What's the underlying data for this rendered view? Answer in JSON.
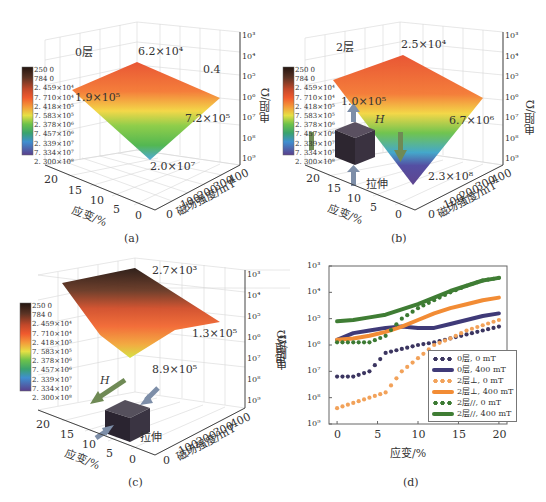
{
  "colorbar": {
    "labels": [
      "250 0",
      "784 0",
      "2. 459×10⁴",
      "7. 710×10⁴",
      "2. 418×10⁵",
      "7. 583×10⁵",
      "2. 378×10⁶",
      "7. 457×10⁶",
      "2. 339×10⁷",
      "7. 334×10⁷",
      "2. 300×10⁸"
    ],
    "colors": [
      "#2b1a14",
      "#5a3324",
      "#8a4a30",
      "#e0582f",
      "#f26a34",
      "#f4c23e",
      "#b9dc3e",
      "#4fb548",
      "#3fa5c9",
      "#4f4aa0",
      "#5a3f8c"
    ]
  },
  "panels": {
    "a": {
      "caption": "(a)",
      "label": "0层",
      "annotations": [
        "6.2×10⁴",
        "0.4",
        "1.9×10⁵",
        "7.2×10⁵",
        "2.0×10⁷"
      ],
      "z_ticks": [
        "10³",
        "10⁴",
        "10⁵",
        "10⁶",
        "10⁷",
        "10⁸",
        "10⁹"
      ],
      "z_label": "电阻/Ω",
      "strain_ticks": [
        "20",
        "15",
        "10",
        "5",
        "0"
      ],
      "strain_label": "应变/%",
      "field_ticks": [
        "0",
        "100",
        "200",
        "300",
        "400"
      ],
      "field_label": "磁场强度/mT"
    },
    "b": {
      "caption": "(b)",
      "label": "2层",
      "annotations": [
        "2.5×10⁴",
        "1.0×10⁵",
        "6.7×10⁶",
        "2.3×10⁸"
      ],
      "field_symbol": "H",
      "stretch_label": "拉伸",
      "z_ticks": [
        "10³",
        "10⁴",
        "10⁵",
        "10⁶",
        "10⁷",
        "10⁸",
        "10⁹"
      ],
      "z_label": "电阻/Ω",
      "strain_ticks": [
        "20",
        "15",
        "10",
        "5",
        "0"
      ],
      "strain_label": "应变/%",
      "field_ticks": [
        "0",
        "100",
        "200",
        "300",
        "400"
      ],
      "field_label": "磁场强度/mT"
    },
    "c": {
      "caption": "(c)",
      "annotations": [
        "2.7×10³",
        "1.3×10⁵",
        "8.9×10⁵"
      ],
      "field_symbol": "H",
      "stretch_label": "拉伸",
      "z_ticks": [
        "10³",
        "10⁴",
        "10⁵",
        "10⁶",
        "10⁷",
        "10⁸",
        "10⁹"
      ],
      "z_label": "电阻/Ω",
      "strain_ticks": [
        "20",
        "15",
        "10",
        "5",
        "0"
      ],
      "strain_label": "应变/%",
      "field_ticks": [
        "0",
        "100",
        "200",
        "300",
        "400"
      ],
      "field_label": "磁场强度/mT"
    },
    "d": {
      "caption": "(d)"
    }
  },
  "chart_data": [
    {
      "type": "surface",
      "panel": "a",
      "title": "0层",
      "xlabel": "应变/%",
      "ylabel": "磁场强度/mT",
      "zlabel": "电阻/Ω",
      "x_ticks": [
        0,
        5,
        10,
        15,
        20
      ],
      "y_ticks": [
        0,
        100,
        200,
        300,
        400
      ],
      "z_ticks": [
        "1e3",
        "1e4",
        "1e5",
        "1e6",
        "1e7",
        "1e8",
        "1e9"
      ],
      "zscale": "log-reversed",
      "annotations": [
        {
          "text": "6.2×10⁴",
          "strain": 20,
          "field": 400
        },
        {
          "text": "1.9×10⁵",
          "strain": 20,
          "field": 0
        },
        {
          "text": "7.2×10⁵",
          "strain": 0,
          "field": 400
        },
        {
          "text": "2.0×10⁷",
          "strain": 0,
          "field": 0
        },
        {
          "text": "0.4",
          "note": "label near back wall"
        }
      ]
    },
    {
      "type": "surface",
      "panel": "b",
      "title": "2层",
      "xlabel": "应变/%",
      "ylabel": "磁场强度/mT",
      "zlabel": "电阻/Ω",
      "x_ticks": [
        0,
        5,
        10,
        15,
        20
      ],
      "y_ticks": [
        0,
        100,
        200,
        300,
        400
      ],
      "z_ticks": [
        "1e3",
        "1e4",
        "1e5",
        "1e6",
        "1e7",
        "1e8",
        "1e9"
      ],
      "zscale": "log-reversed",
      "annotations": [
        {
          "text": "2.5×10⁴",
          "strain": 20,
          "field": 400
        },
        {
          "text": "1.0×10⁵",
          "strain": 20,
          "field": 0
        },
        {
          "text": "6.7×10⁶",
          "strain": 0,
          "field": 400
        },
        {
          "text": "2.3×10⁸",
          "strain": 0,
          "field": 0
        }
      ],
      "inset": "field H perpendicular to stretching direction (拉伸)"
    },
    {
      "type": "surface",
      "panel": "c",
      "xlabel": "应变/%",
      "ylabel": "磁场强度/mT",
      "zlabel": "电阻/Ω",
      "x_ticks": [
        0,
        5,
        10,
        15,
        20
      ],
      "y_ticks": [
        0,
        100,
        200,
        300,
        400
      ],
      "z_ticks": [
        "1e3",
        "1e4",
        "1e5",
        "1e6",
        "1e7",
        "1e8",
        "1e9"
      ],
      "zscale": "log-reversed",
      "annotations": [
        {
          "text": "2.7×10³",
          "strain": 20,
          "field": 400
        },
        {
          "text": "1.3×10⁵",
          "strain": 0,
          "field": 400
        },
        {
          "text": "8.9×10⁵",
          "strain": 0,
          "field": 0
        }
      ],
      "inset": "field H parallel to stretching direction (拉伸)"
    },
    {
      "type": "line",
      "panel": "d",
      "xlabel": "应变/%",
      "ylabel": "电阻/Ω",
      "x_ticks": [
        0,
        5,
        10,
        15,
        20
      ],
      "y_ticks": [
        "10³",
        "10⁴",
        "10⁵",
        "10⁶",
        "10⁷",
        "10⁸",
        "10⁹"
      ],
      "xlim": [
        -1,
        21
      ],
      "ylim_log10": [
        9,
        3
      ],
      "yscale": "log-reversed",
      "legend_position": "lower right",
      "x": [
        0,
        2,
        4,
        6,
        8,
        10,
        12,
        14,
        16,
        18,
        20
      ],
      "series": [
        {
          "name": "0层, 0 mT",
          "style": "dotted",
          "color": "#3b3560",
          "log10_values": [
            7.2,
            7.2,
            7.0,
            6.3,
            6.15,
            6.0,
            5.9,
            5.75,
            5.6,
            5.45,
            5.3
          ]
        },
        {
          "name": "0层, 400 mT",
          "style": "solid",
          "color": "#3f3a78",
          "log10_values": [
            5.8,
            5.55,
            5.45,
            5.35,
            5.3,
            5.35,
            5.35,
            5.2,
            5.05,
            4.9,
            4.8
          ]
        },
        {
          "name": "2层⊥, 0 mT",
          "style": "dotted",
          "color": "#f2a25a",
          "log10_values": [
            8.4,
            8.2,
            8.0,
            7.8,
            7.0,
            6.5,
            6.0,
            5.75,
            5.45,
            5.25,
            5.05
          ]
        },
        {
          "name": "2层⊥, 400 mT",
          "style": "solid",
          "color": "#f28c35",
          "log10_values": [
            5.8,
            5.75,
            5.65,
            5.5,
            5.3,
            5.05,
            4.8,
            4.6,
            4.45,
            4.3,
            4.2
          ]
        },
        {
          "name": "2层//, 0 mT",
          "style": "dotted",
          "color": "#3c7a33",
          "log10_values": [
            5.9,
            5.9,
            5.9,
            5.65,
            5.0,
            4.6,
            4.3,
            4.0,
            3.75,
            3.55,
            3.45
          ]
        },
        {
          "name": "2层//, 400 mT",
          "style": "solid",
          "color": "#3f7d34",
          "log10_values": [
            5.1,
            5.05,
            4.95,
            4.85,
            4.65,
            4.45,
            4.2,
            3.95,
            3.75,
            3.55,
            3.45
          ]
        }
      ]
    }
  ]
}
